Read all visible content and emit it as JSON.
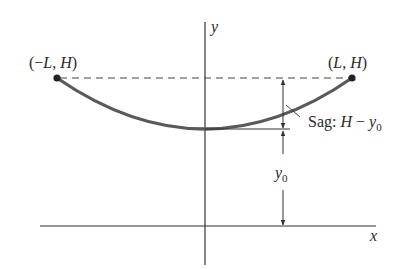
{
  "diagram": {
    "type": "hanging cable / catenary sag diagram",
    "axes": {
      "x_label": "x",
      "y_label": "y"
    },
    "points": {
      "left": {
        "label": "(−L, H)",
        "label_parts": [
          "(−",
          "L",
          ", ",
          "H",
          ")"
        ]
      },
      "right": {
        "label": "(L, H)",
        "label_parts": [
          "(",
          "L",
          ", ",
          "H",
          ")"
        ]
      }
    },
    "annotations": {
      "sag": {
        "label": "Sag: H − y0",
        "prefix": "Sag: ",
        "var1": "H",
        "minus": " − ",
        "var2": "y",
        "sub": "0"
      },
      "y0": {
        "label": "y0",
        "var": "y",
        "sub": "0"
      }
    },
    "colors": {
      "curve": "#5a5a5a",
      "axes": "#333333",
      "dashed": "#444444",
      "text": "#2a2a2a"
    }
  }
}
